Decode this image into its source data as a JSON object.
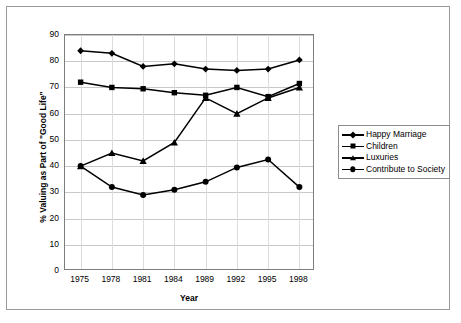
{
  "chart_data": {
    "type": "line",
    "title": "",
    "xlabel": "Year",
    "ylabel": "% Valuing as Part of \"Good Life\"",
    "categories": [
      "1975",
      "1978",
      "1981",
      "1984",
      "1989",
      "1992",
      "1995",
      "1998"
    ],
    "x": [
      1975,
      1978,
      1981,
      1984,
      1989,
      1992,
      1995,
      1998
    ],
    "ylim": [
      0,
      90
    ],
    "ytick_labels": [
      "0",
      "10",
      "20",
      "30",
      "40",
      "50",
      "60",
      "70",
      "80",
      "90"
    ],
    "ytick_values": [
      0,
      10,
      20,
      30,
      40,
      50,
      60,
      70,
      80,
      90
    ],
    "grid": "horizontal",
    "legend_position": "right",
    "series": [
      {
        "name": "Happy Marriage",
        "marker": "diamond",
        "color": "#000000",
        "values": [
          84,
          83,
          78,
          79,
          77,
          76.5,
          77,
          80.5
        ]
      },
      {
        "name": "Children",
        "marker": "square",
        "color": "#000000",
        "values": [
          72,
          70,
          69.5,
          68,
          67,
          70,
          66.5,
          71.5
        ]
      },
      {
        "name": "Luxuries",
        "marker": "triangle",
        "color": "#000000",
        "values": [
          40,
          45,
          42,
          49,
          66,
          60,
          66,
          70
        ]
      },
      {
        "name": "Contribute to Society",
        "marker": "circle",
        "color": "#000000",
        "values": [
          40,
          32,
          29,
          31,
          34,
          39.5,
          42.5,
          32
        ]
      }
    ]
  },
  "legend": {
    "entries": [
      {
        "label": "Happy Marriage",
        "marker": "diamond"
      },
      {
        "label": "Children",
        "marker": "square"
      },
      {
        "label": "Luxuries",
        "marker": "triangle"
      },
      {
        "label": "Contribute to Society",
        "marker": "circle"
      }
    ]
  },
  "colors": {
    "series": "#000000",
    "gridline": "#c8c8c8",
    "plot_border": "#7d7d7d",
    "outer_border": "#9a9a9a",
    "background": "#ffffff"
  }
}
